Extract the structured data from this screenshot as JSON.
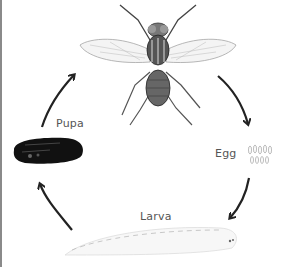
{
  "diagram": {
    "title": "",
    "type": "life-cycle",
    "stages": [
      {
        "id": "adult",
        "label": "",
        "depiction": "adult-fly-illustration"
      },
      {
        "id": "egg",
        "label": "Egg",
        "depiction": "egg-cluster-illustration"
      },
      {
        "id": "larva",
        "label": "Larva",
        "depiction": "larva-illustration"
      },
      {
        "id": "pupa",
        "label": "Pupa",
        "depiction": "pupa-illustration"
      }
    ],
    "arrows": [
      {
        "from": "adult",
        "to": "egg"
      },
      {
        "from": "egg",
        "to": "larva"
      },
      {
        "from": "larva",
        "to": "pupa"
      },
      {
        "from": "pupa",
        "to": "adult"
      }
    ],
    "colors": {
      "arrow": "#222222",
      "label": "#555555",
      "pupa": "#111111",
      "background": "#ffffff"
    }
  }
}
